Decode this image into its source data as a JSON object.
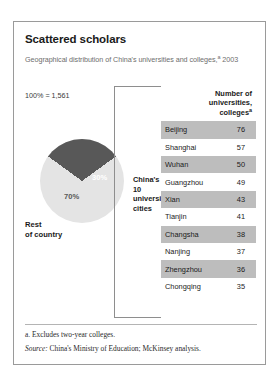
{
  "exhibit": {
    "title": "Scattered scholars",
    "subtitle_text": "Geographical distribution of China's universities and colleges,",
    "subtitle_marker": "a",
    "subtitle_year": "2003",
    "total_label": "100% = 1,561",
    "callout": "China's top 10 university cities",
    "rest_label_line1": "Rest",
    "rest_label_line2": "of country",
    "footnote": "a.  Excludes two-year colleges.",
    "source_prefix": "Source:",
    "source_text": "China's Ministry of Education; McKinsey analysis.",
    "colors": {
      "dark_slice": "#585858",
      "light_slice": "#e4e4e4",
      "row_shade": "#bdbdbd",
      "border": "#9a9a9a"
    }
  },
  "table": {
    "header_line1": "Number of",
    "header_line2": "universities,",
    "header_line3": "colleges",
    "header_marker": "a",
    "rows": [
      {
        "city": "Beijing",
        "value": "76"
      },
      {
        "city": "Shanghai",
        "value": "57"
      },
      {
        "city": "Wuhan",
        "value": "50"
      },
      {
        "city": "Guangzhou",
        "value": "49"
      },
      {
        "city": "Xian",
        "value": "43"
      },
      {
        "city": "Tianjin",
        "value": "41"
      },
      {
        "city": "Changsha",
        "value": "38"
      },
      {
        "city": "Nanjing",
        "value": "37"
      },
      {
        "city": "Zhengzhou",
        "value": "36"
      },
      {
        "city": "Chongqing",
        "value": "35"
      }
    ]
  },
  "chart_data": {
    "type": "pie",
    "title": "Scattered scholars",
    "subtitle": "Geographical distribution of China's universities and colleges, 2003",
    "total": 1561,
    "total_label": "100% = 1,561",
    "categories": [
      "China's top 10 university cities",
      "Rest of country"
    ],
    "values": [
      30,
      70
    ],
    "value_labels": [
      "30%",
      "70%"
    ],
    "units": "percent",
    "legend": "inline-labels",
    "slice_colors": [
      "#585858",
      "#e4e4e4"
    ],
    "breakdown": {
      "type": "table",
      "columns": [
        "City",
        "Number of universities, colleges"
      ],
      "categories": [
        "Beijing",
        "Shanghai",
        "Wuhan",
        "Guangzhou",
        "Xian",
        "Tianjin",
        "Changsha",
        "Nanjing",
        "Zhengzhou",
        "Chongqing"
      ],
      "values": [
        76,
        57,
        50,
        49,
        43,
        41,
        38,
        37,
        36,
        35
      ]
    }
  }
}
